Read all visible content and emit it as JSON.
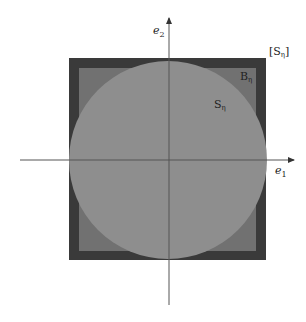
{
  "diagram": {
    "type": "set-inclusion-figure",
    "colors": {
      "background": "#ffffff",
      "outer_square": "#3a3a3a",
      "inner_square": "#717171",
      "circle": "#8e8e8e",
      "axis": "#555555",
      "label": "#222222"
    },
    "axes": {
      "horizontal": {
        "label": "e",
        "subscript": "1"
      },
      "vertical": {
        "label": "e",
        "subscript": "2"
      }
    },
    "regions": [
      {
        "id": "outer",
        "label": "[S",
        "subscript": "η",
        "suffix": "]"
      },
      {
        "id": "inner",
        "label": "B",
        "subscript": "η"
      },
      {
        "id": "circle",
        "label": "S",
        "subscript": "η"
      }
    ]
  }
}
